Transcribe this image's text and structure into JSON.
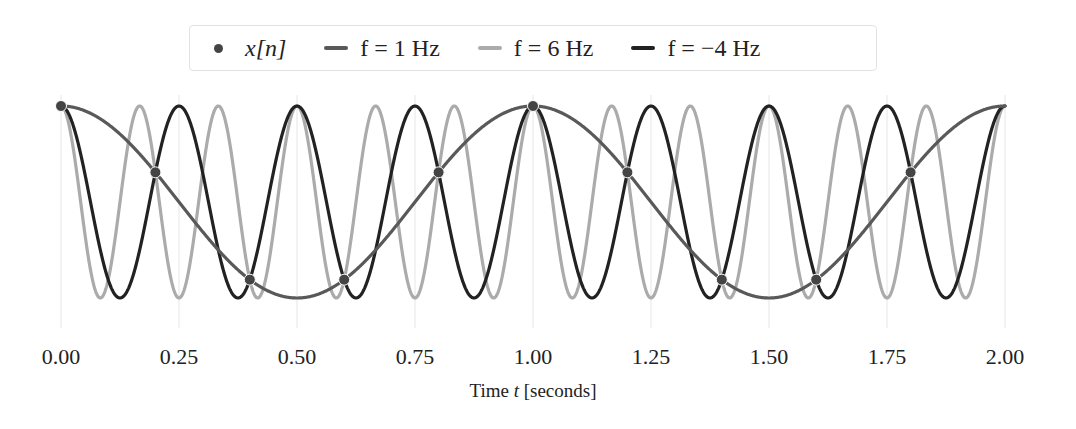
{
  "chart_data": {
    "type": "line",
    "title": "",
    "xlabel": "Time t [seconds]",
    "ylabel": "",
    "xlim": [
      0,
      2
    ],
    "ylim": [
      -1.15,
      1.15
    ],
    "x_ticks": [
      "0.00",
      "0.25",
      "0.50",
      "0.75",
      "1.00",
      "1.25",
      "1.50",
      "1.75",
      "2.00"
    ],
    "y_ticks": [],
    "grid": "vertical gridlines at x ticks",
    "legend_position": "top center (above plot)",
    "series": [
      {
        "name": "x[n]",
        "kind": "scatter",
        "color": "#444444",
        "x": [
          0.0,
          0.2,
          0.4,
          0.6,
          0.8,
          1.0,
          1.2,
          1.4,
          1.6,
          1.8
        ],
        "y": [
          1.0,
          0.309,
          -0.809,
          -0.809,
          0.309,
          1.0,
          0.309,
          -0.809,
          -0.809,
          0.309
        ]
      },
      {
        "name": "f = 1 Hz",
        "kind": "line",
        "frequency_hz": 1,
        "function": "cos(2*pi*1*t)",
        "color": "#595959"
      },
      {
        "name": "f = 6 Hz",
        "kind": "line",
        "frequency_hz": 6,
        "function": "cos(2*pi*6*t)",
        "color": "#ababab"
      },
      {
        "name": "f = -4 Hz",
        "kind": "line",
        "frequency_hz": -4,
        "function": "cos(2*pi*(-4)*t)",
        "color": "#222222"
      }
    ]
  },
  "legend": {
    "items": [
      {
        "label": "x[n]",
        "symbol": "dot",
        "color": "#444444"
      },
      {
        "label": "f = 1 Hz",
        "symbol": "line",
        "color": "#595959"
      },
      {
        "label": "f = 6 Hz",
        "symbol": "line",
        "color": "#ababab"
      },
      {
        "label": "f = −4 Hz",
        "symbol": "line",
        "color": "#222222"
      }
    ]
  },
  "axis": {
    "xlabel_prefix": "Time ",
    "xlabel_var": "t",
    "xlabel_suffix": " [seconds]"
  }
}
